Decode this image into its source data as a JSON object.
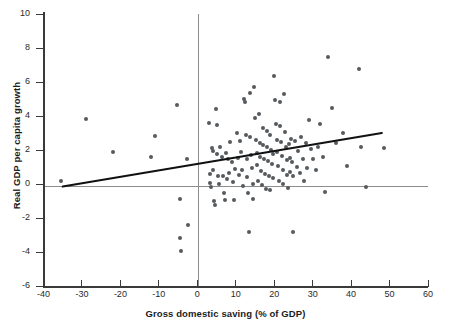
{
  "chart_data": {
    "type": "scatter",
    "title": "",
    "xlabel": "Gross domestic saving (% of GDP)",
    "ylabel": "Real GDP per capita growth",
    "xlim": [
      -40,
      60
    ],
    "ylim": [
      -6,
      10
    ],
    "xticks": [
      -40,
      -30,
      -20,
      -10,
      0,
      10,
      20,
      30,
      40,
      50,
      60
    ],
    "xticklabels": [
      "-40",
      "-30",
      "-20",
      "-10",
      "0",
      "10",
      "20",
      "30",
      "40",
      "50",
      "60"
    ],
    "yticks": [
      -6,
      -4,
      -2,
      0,
      2,
      4,
      6,
      8,
      10
    ],
    "yticklabels": [
      "-6",
      "-4",
      "-2",
      "0",
      "2",
      "4",
      "6",
      "8",
      "10"
    ],
    "grid": false,
    "legend": null,
    "marker_color": "#555a5e",
    "fit_line_color": "#111111",
    "zero_line_color": "#8d8d8d",
    "reference_lines": [
      {
        "name": "y-zero",
        "orientation": "horizontal",
        "value": 0
      },
      {
        "name": "x-zero",
        "orientation": "vertical",
        "value": 0
      }
    ],
    "fit_line": {
      "name": "linear regression",
      "x_start": -35.0,
      "y_start": -0.15,
      "x_end": 48.0,
      "y_end": 3.0,
      "slope": 0.038,
      "intercept": 1.18
    },
    "points": [
      [
        -35.5,
        0.15
      ],
      [
        -29.0,
        3.8
      ],
      [
        -22.0,
        1.9
      ],
      [
        -12.0,
        1.6
      ],
      [
        -11.0,
        2.85
      ],
      [
        -5.2,
        4.65
      ],
      [
        -4.6,
        -0.9
      ],
      [
        -4.5,
        -3.15
      ],
      [
        -4.3,
        -3.95
      ],
      [
        -2.6,
        1.45
      ],
      [
        -2.4,
        -2.4
      ],
      [
        3.0,
        3.6
      ],
      [
        3.2,
        0.6
      ],
      [
        3.4,
        0.05
      ],
      [
        3.6,
        -0.2
      ],
      [
        3.8,
        2.1
      ],
      [
        4.0,
        1.95
      ],
      [
        4.2,
        0.8
      ],
      [
        4.4,
        -1.0
      ],
      [
        4.6,
        -1.25
      ],
      [
        4.8,
        4.4
      ],
      [
        5.0,
        3.5
      ],
      [
        5.2,
        1.75
      ],
      [
        5.4,
        0.5
      ],
      [
        5.6,
        0.0
      ],
      [
        6.0,
        2.2
      ],
      [
        6.3,
        1.6
      ],
      [
        6.6,
        0.45
      ],
      [
        6.9,
        -0.55
      ],
      [
        7.2,
        -0.95
      ],
      [
        7.4,
        1.8
      ],
      [
        7.8,
        0.3
      ],
      [
        8.0,
        1.5
      ],
      [
        8.3,
        0.65
      ],
      [
        8.6,
        2.5
      ],
      [
        9.0,
        1.3
      ],
      [
        9.3,
        0.1
      ],
      [
        9.6,
        -0.95
      ],
      [
        9.9,
        0.9
      ],
      [
        10.2,
        3.0
      ],
      [
        10.5,
        1.55
      ],
      [
        10.8,
        0.55
      ],
      [
        11.0,
        2.55
      ],
      [
        11.3,
        1.9
      ],
      [
        11.6,
        0.85
      ],
      [
        11.9,
        -0.1
      ],
      [
        12.2,
        5.0
      ],
      [
        12.4,
        4.8
      ],
      [
        12.6,
        2.9
      ],
      [
        12.8,
        1.45
      ],
      [
        13.0,
        0.4
      ],
      [
        13.2,
        -0.5
      ],
      [
        13.4,
        -2.8
      ],
      [
        13.6,
        5.35
      ],
      [
        13.8,
        2.75
      ],
      [
        14.0,
        1.7
      ],
      [
        14.2,
        0.95
      ],
      [
        14.4,
        0.0
      ],
      [
        14.6,
        -0.9
      ],
      [
        14.8,
        5.7
      ],
      [
        15.0,
        3.9
      ],
      [
        15.2,
        2.6
      ],
      [
        15.4,
        1.85
      ],
      [
        15.6,
        1.1
      ],
      [
        15.8,
        0.2
      ],
      [
        16.0,
        4.1
      ],
      [
        16.2,
        2.4
      ],
      [
        16.4,
        1.6
      ],
      [
        16.6,
        0.75
      ],
      [
        16.8,
        -0.05
      ],
      [
        17.0,
        3.3
      ],
      [
        17.2,
        2.3
      ],
      [
        17.4,
        1.45
      ],
      [
        17.6,
        0.6
      ],
      [
        17.8,
        -0.3
      ],
      [
        18.0,
        3.1
      ],
      [
        18.2,
        2.15
      ],
      [
        18.4,
        1.35
      ],
      [
        18.6,
        0.5
      ],
      [
        18.8,
        -0.35
      ],
      [
        19.0,
        2.9
      ],
      [
        19.2,
        2.0
      ],
      [
        19.4,
        1.2
      ],
      [
        19.6,
        0.35
      ],
      [
        19.8,
        1.75
      ],
      [
        20.0,
        6.35
      ],
      [
        20.2,
        4.95
      ],
      [
        20.4,
        3.55
      ],
      [
        20.6,
        2.6
      ],
      [
        20.8,
        1.9
      ],
      [
        21.0,
        1.05
      ],
      [
        21.2,
        0.15
      ],
      [
        21.4,
        4.85
      ],
      [
        21.6,
        3.4
      ],
      [
        21.8,
        2.45
      ],
      [
        22.0,
        1.65
      ],
      [
        22.2,
        0.8
      ],
      [
        22.4,
        0.0
      ],
      [
        22.6,
        5.3
      ],
      [
        22.8,
        3.05
      ],
      [
        23.0,
        2.2
      ],
      [
        23.2,
        1.4
      ],
      [
        23.4,
        0.55
      ],
      [
        23.6,
        -0.25
      ],
      [
        23.8,
        2.35
      ],
      [
        24.0,
        1.55
      ],
      [
        24.2,
        0.7
      ],
      [
        24.4,
        2.65
      ],
      [
        24.6,
        1.3
      ],
      [
        24.8,
        0.45
      ],
      [
        25.0,
        -2.8
      ],
      [
        25.4,
        2.55
      ],
      [
        25.8,
        1.0
      ],
      [
        26.2,
        1.95
      ],
      [
        26.6,
        0.65
      ],
      [
        27.0,
        2.75
      ],
      [
        27.4,
        1.5
      ],
      [
        27.8,
        0.2
      ],
      [
        28.2,
        2.4
      ],
      [
        28.6,
        0.95
      ],
      [
        29.0,
        3.75
      ],
      [
        29.6,
        2.05
      ],
      [
        30.2,
        1.45
      ],
      [
        30.8,
        0.85
      ],
      [
        31.4,
        2.15
      ],
      [
        32.0,
        3.55
      ],
      [
        32.6,
        1.6
      ],
      [
        33.2,
        -0.45
      ],
      [
        34.0,
        7.5
      ],
      [
        35.0,
        4.45
      ],
      [
        36.0,
        2.4
      ],
      [
        38.0,
        3.0
      ],
      [
        39.0,
        1.05
      ],
      [
        42.0,
        6.75
      ],
      [
        42.5,
        2.15
      ],
      [
        44.0,
        -0.15
      ],
      [
        48.5,
        2.1
      ]
    ]
  }
}
